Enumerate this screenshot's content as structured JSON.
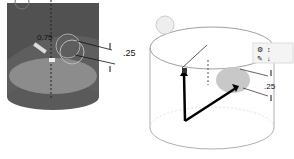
{
  "left_view": {
    "style": "shaded",
    "body_color": "#5e5e5e",
    "bottom_color": "#8a8a8a",
    "diameter_label": "0.75",
    "offset_label": ".25"
  },
  "right_view": {
    "style": "transparent",
    "offset_label": ".25",
    "toolbar_glyphs": [
      "⚙",
      "↕",
      "✎",
      "↓"
    ]
  }
}
